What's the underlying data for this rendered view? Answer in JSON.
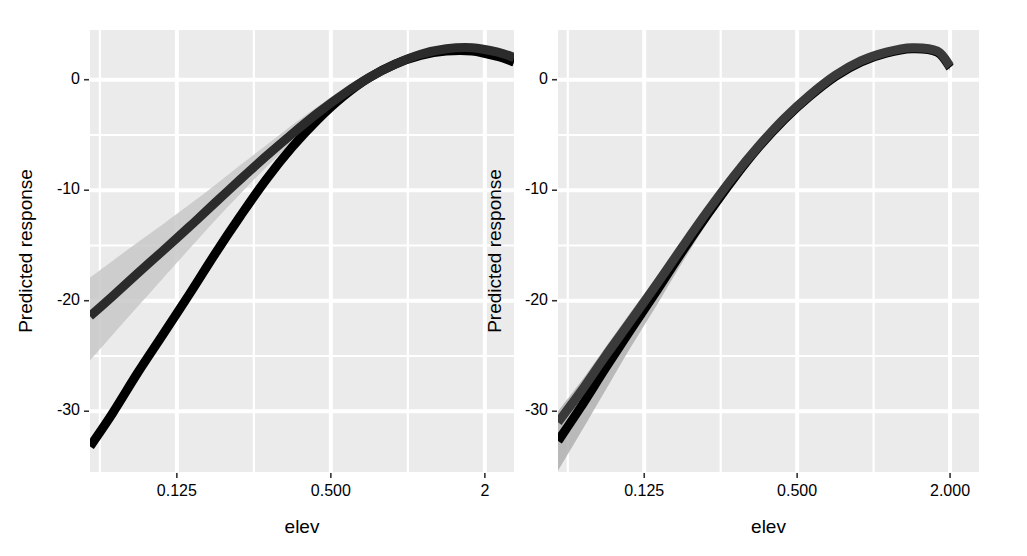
{
  "figure": {
    "background": "#ffffff",
    "panel_background": "#ebebeb",
    "grid_color": "#ffffff",
    "line_color_dark": "#000000",
    "line_color_mid": "#333333",
    "ribbon_color": "#b0b0b0",
    "ribbon_color_light": "#c8c8c8",
    "n_panels": 2
  },
  "chart_data": [
    {
      "type": "line",
      "panel": "left",
      "title": "",
      "xlabel": "elev",
      "ylabel": "Predicted response",
      "x_scale": "log2",
      "x_ticks": [
        0.125,
        0.5,
        2.0
      ],
      "x_tick_labels": [
        "0.125",
        "0.500",
        "2"
      ],
      "x_tick_labels_full": [
        "0.125",
        "0.500",
        "2.000"
      ],
      "xlim": [
        0.0572,
        2.6
      ],
      "y_ticks": [
        0,
        -10,
        -20,
        -30
      ],
      "y_tick_labels": [
        "0",
        "-10",
        "-20",
        "-30"
      ],
      "ylim": [
        -35.5,
        4.5
      ],
      "y_minor_gridlines": [
        -5,
        -15,
        -25
      ],
      "x_minor_gridlines": [
        0.0625,
        0.25,
        1.0
      ],
      "grid": true,
      "legend": "none",
      "series": [
        {
          "name": "curve-a",
          "color": "#000000",
          "x": [
            0.0572,
            0.07,
            0.088,
            0.11,
            0.14,
            0.177,
            0.222,
            0.28,
            0.353,
            0.445,
            0.56,
            0.707,
            0.89,
            1.122,
            1.414,
            1.782,
            2.245,
            2.6
          ],
          "y": [
            -33.2,
            -30.2,
            -26.5,
            -23.1,
            -19.4,
            -15.7,
            -12.3,
            -9.0,
            -6.1,
            -3.6,
            -1.5,
            0.2,
            1.4,
            2.2,
            2.6,
            2.6,
            2.1,
            1.6
          ]
        },
        {
          "name": "curve-b",
          "color": "#2b2b2b",
          "x": [
            0.0572,
            0.07,
            0.088,
            0.11,
            0.14,
            0.177,
            0.222,
            0.28,
            0.353,
            0.445,
            0.56,
            0.707,
            0.89,
            1.122,
            1.414,
            1.782,
            2.245,
            2.6
          ],
          "y": [
            -21.4,
            -19.6,
            -17.5,
            -15.5,
            -13.3,
            -11.1,
            -9.0,
            -6.9,
            -4.9,
            -3.0,
            -1.3,
            0.2,
            1.4,
            2.3,
            2.8,
            2.9,
            2.5,
            2.0
          ],
          "ribbon_lo": [
            -25.4,
            -23.1,
            -20.5,
            -18.0,
            -15.3,
            -12.7,
            -10.3,
            -7.9,
            -5.7,
            -3.7,
            -1.9,
            -0.3,
            1.0,
            1.9,
            2.4,
            2.5,
            2.0,
            1.4
          ],
          "ribbon_hi": [
            -17.9,
            -16.4,
            -14.7,
            -13.1,
            -11.3,
            -9.5,
            -7.7,
            -5.9,
            -4.1,
            -2.4,
            -0.8,
            0.6,
            1.8,
            2.6,
            3.1,
            3.2,
            2.9,
            2.5
          ]
        }
      ]
    },
    {
      "type": "line",
      "panel": "right",
      "title": "",
      "xlabel": "elev",
      "ylabel": "Predicted response",
      "x_scale": "log2",
      "x_ticks": [
        0.125,
        0.5,
        2.0
      ],
      "x_tick_labels": [
        "0.125",
        "0.500",
        "2.000"
      ],
      "xlim": [
        0.0572,
        2.6
      ],
      "y_ticks": [
        0,
        -10,
        -20,
        -30
      ],
      "y_tick_labels": [
        "0",
        "-10",
        "-20",
        "-30"
      ],
      "ylim": [
        -35.5,
        4.5
      ],
      "y_minor_gridlines": [
        -5,
        -15,
        -25
      ],
      "x_minor_gridlines": [
        0.0625,
        0.25,
        1.0
      ],
      "grid": true,
      "legend": "none",
      "series": [
        {
          "name": "curve-a",
          "color": "#000000",
          "x": [
            0.0572,
            0.07,
            0.088,
            0.11,
            0.14,
            0.177,
            0.222,
            0.28,
            0.353,
            0.445,
            0.56,
            0.707,
            0.89,
            1.122,
            1.414,
            1.782,
            2.0
          ],
          "y": [
            -32.7,
            -29.7,
            -26.1,
            -22.7,
            -19.1,
            -15.5,
            -12.2,
            -9.0,
            -6.1,
            -3.6,
            -1.5,
            0.3,
            1.6,
            2.4,
            2.8,
            2.5,
            1.1
          ],
          "ribbon_lo": [
            -35.4,
            -32.0,
            -28.1,
            -24.3,
            -20.4,
            -16.5,
            -12.9,
            -9.5,
            -6.5,
            -3.9,
            -1.8,
            0.0,
            1.3,
            2.1,
            2.5,
            2.2,
            0.8
          ],
          "ribbon_hi": [
            -30.0,
            -27.4,
            -24.2,
            -21.1,
            -17.8,
            -14.5,
            -11.5,
            -8.5,
            -5.7,
            -3.3,
            -1.2,
            0.6,
            1.9,
            2.7,
            3.1,
            2.8,
            1.4
          ]
        },
        {
          "name": "curve-b",
          "color": "#3a3a3a",
          "x": [
            0.0572,
            0.07,
            0.088,
            0.11,
            0.14,
            0.177,
            0.222,
            0.28,
            0.353,
            0.445,
            0.56,
            0.707,
            0.89,
            1.122,
            1.414,
            1.782,
            2.0
          ],
          "y": [
            -31.0,
            -28.3,
            -25.0,
            -21.9,
            -18.5,
            -15.1,
            -11.9,
            -8.8,
            -6.0,
            -3.5,
            -1.4,
            0.4,
            1.7,
            2.5,
            2.9,
            2.6,
            1.2
          ]
        }
      ]
    }
  ],
  "panels": [
    {
      "id": "left",
      "axis_title_y": "Predicted response",
      "axis_title_x": "elev",
      "y_tick_labels": [
        "0",
        "-10",
        "-20",
        "-30"
      ],
      "x_tick_labels": [
        "0.125",
        "0.500",
        "2"
      ]
    },
    {
      "id": "right",
      "axis_title_y": "Predicted response",
      "axis_title_x": "elev",
      "y_tick_labels": [
        "0",
        "-10",
        "-20",
        "-30"
      ],
      "x_tick_labels": [
        "0.125",
        "0.500",
        "2.000"
      ]
    }
  ]
}
